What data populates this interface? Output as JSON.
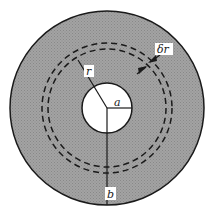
{
  "diagram": {
    "colors": {
      "fill": "#9a9a9a",
      "stroke": "#1a1a1a",
      "hole": "#ffffff",
      "label_bg": "#ffffff"
    },
    "labels": {
      "r": "r",
      "a": "a",
      "b": "b",
      "dr": "δr"
    }
  }
}
